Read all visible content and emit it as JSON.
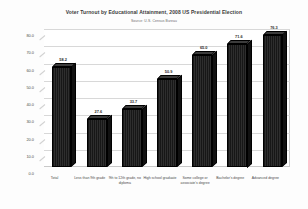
{
  "chart_data": {
    "type": "bar",
    "title": "Voter Turnout by Educational Attainment, 2008 US Presidential Election",
    "subtitle": "Source: U.S. Census Bureau",
    "xlabel": "",
    "ylabel": "",
    "ylim": [
      0,
      80
    ],
    "grid": true,
    "legend": "none",
    "style": "3d-column",
    "bar_color": "#1c1c1c",
    "categories": [
      "Total",
      "Less than 9th grade",
      "9th to 12th grade, no diploma",
      "High school graduate",
      "Some college or associate's degree",
      "Bachelor's degree",
      "Advanced degree"
    ],
    "values": [
      58.2,
      27.6,
      33.7,
      50.9,
      65.0,
      71.6,
      76.3
    ],
    "value_labels": [
      "58.2",
      "27.6",
      "33.7",
      "50.9",
      "65.0",
      "71.6",
      "76.3"
    ],
    "yticks": [
      0,
      10,
      20,
      30,
      40,
      50,
      60,
      70,
      80
    ],
    "ytick_labels": [
      "0.0",
      "10.0",
      "20.0",
      "30.0",
      "40.0",
      "50.0",
      "60.0",
      "70.0",
      "80.0"
    ]
  }
}
